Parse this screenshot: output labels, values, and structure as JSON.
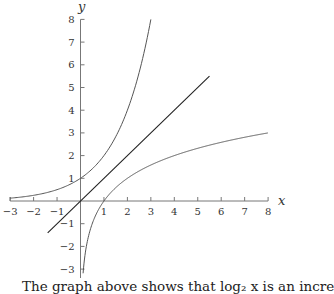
{
  "chart_data": {
    "type": "line",
    "title": "",
    "xlabel": "x",
    "ylabel": "y",
    "xlim": [
      -3,
      8
    ],
    "ylim": [
      -3.5,
      8
    ],
    "x_ticks": [
      -3,
      -2,
      -1,
      1,
      2,
      3,
      4,
      5,
      6,
      7,
      8
    ],
    "y_ticks": [
      -3,
      -2,
      -1,
      1,
      2,
      3,
      4,
      5,
      6,
      7,
      8
    ],
    "grid": false,
    "legend": null,
    "series": [
      {
        "name": "y = 2^x (exponential)",
        "function": "2^x",
        "x": [
          -3,
          -2,
          -1,
          0,
          1,
          2,
          3
        ],
        "y": [
          0.125,
          0.25,
          0.5,
          1,
          2,
          4,
          8
        ]
      },
      {
        "name": "y = x (line of reflection)",
        "function": "x",
        "x": [
          -1.4,
          5.5
        ],
        "y": [
          -1.4,
          5.5
        ]
      },
      {
        "name": "y = log2 x (logarithm)",
        "function": "log2(x)",
        "x": [
          0.125,
          0.25,
          0.5,
          1,
          2,
          4,
          8
        ],
        "y": [
          -3,
          -2,
          -1,
          0,
          1,
          2,
          3
        ]
      }
    ],
    "colors": {
      "curves": "#555555",
      "line": "#222222",
      "axes": "#777777"
    }
  },
  "caption": "The graph above shows that log₂ x is an incre"
}
